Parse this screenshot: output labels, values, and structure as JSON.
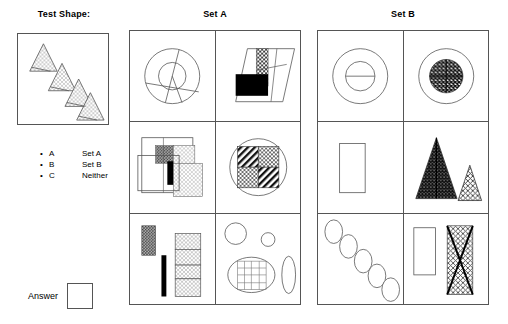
{
  "headers": {
    "test_shape": "Test Shape:",
    "set_a": "Set A",
    "set_b": "Set B"
  },
  "legend": {
    "rows": [
      {
        "bullet": "•",
        "key": "A",
        "value": "Set A"
      },
      {
        "bullet": "•",
        "key": "B",
        "value": "Set B"
      },
      {
        "bullet": "•",
        "key": "C",
        "value": "Neither"
      }
    ]
  },
  "answer": {
    "label": "Answer",
    "value": ""
  },
  "colors": {
    "stroke": "#555555",
    "ink": "#000000",
    "background": "#ffffff",
    "fill_dark": "#000000",
    "fill_mid": "#5a5a5a",
    "fill_light": "#d8d8d8"
  },
  "test_shape": {
    "description": "Four stippled triangles arranged along a descending diagonal, each with an internal line",
    "item_count": 4,
    "items": [
      {
        "shape": "triangle",
        "fill": "stipple-light",
        "size": "medium"
      },
      {
        "shape": "triangle",
        "fill": "stipple-light",
        "size": "medium"
      },
      {
        "shape": "triangle",
        "fill": "stipple-light",
        "size": "medium"
      },
      {
        "shape": "triangle",
        "fill": "stipple-light",
        "size": "medium"
      }
    ]
  },
  "set_a": {
    "cells": [
      {
        "position": "row1-col1",
        "description": "Concentric circles crossed by three chords"
      },
      {
        "position": "row1-col2",
        "description": "Parallelogram with black rectangle and stippled vertical strip"
      },
      {
        "position": "row2-col1",
        "description": "Overlapping squares with dark-stipple, light-stipple and black bar"
      },
      {
        "position": "row2-col2",
        "description": "Circle containing a four-quadrant hatched and stippled square"
      },
      {
        "position": "row3-col1",
        "description": "Stippled bar, solid black bar and segmented stippled column"
      },
      {
        "position": "row3-col2",
        "description": "Two circles, a gridded ellipse and a narrow vertical ellipse"
      }
    ]
  },
  "set_b": {
    "cells": [
      {
        "position": "row1-col1",
        "description": "Concentric circles with a horizontal line through the inner circle"
      },
      {
        "position": "row1-col2",
        "description": "Outer circle with dark cross-hatched inner disc and crosshair"
      },
      {
        "position": "row2-col1",
        "description": "Single empty vertical rectangle"
      },
      {
        "position": "row2-col2",
        "description": "Large dark textured triangle with centre line beside a small light textured triangle"
      },
      {
        "position": "row3-col1",
        "description": "Five ellipses arranged along a descending diagonal"
      },
      {
        "position": "row3-col2",
        "description": "Empty vertical rectangle beside a textured rectangle crossed by a bold X"
      }
    ]
  }
}
